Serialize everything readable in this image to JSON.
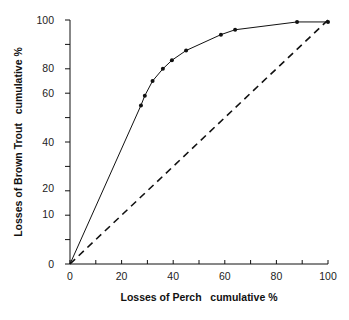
{
  "chart_data": {
    "type": "line",
    "title": "",
    "xlabel": "Losses of Perch   cumulative %",
    "ylabel": "Losses of Brown Trout   cumulative %",
    "xlim": [
      0,
      100
    ],
    "ylim": [
      0,
      100
    ],
    "grid": false,
    "legend": null,
    "x_ticks": [
      0,
      10,
      20,
      30,
      40,
      50,
      60,
      70,
      80,
      90,
      100
    ],
    "x_tick_labels": [
      {
        "value": 0,
        "label": "0"
      },
      {
        "value": 20,
        "label": "20"
      },
      {
        "value": 40,
        "label": "40"
      },
      {
        "value": 60,
        "label": "60"
      },
      {
        "value": 80,
        "label": "80"
      },
      {
        "value": 100,
        "label": "100"
      }
    ],
    "y_ticks": [
      0,
      10,
      20,
      30,
      40,
      50,
      60,
      70,
      80,
      90,
      100
    ],
    "y_tick_labels": [
      {
        "pos": 0,
        "label": "0"
      },
      {
        "pos": 20.5,
        "label": "10"
      },
      {
        "pos": 31,
        "label": "20"
      },
      {
        "pos": 50,
        "label": "40"
      },
      {
        "pos": 70,
        "label": "60"
      },
      {
        "pos": 80.5,
        "label": "80"
      },
      {
        "pos": 100,
        "label": "100"
      }
    ],
    "series": [
      {
        "name": "Observed cumulative losses",
        "style": "solid",
        "markers": true,
        "x": [
          0,
          27.5,
          29,
          32,
          36,
          39.5,
          45,
          58.5,
          64,
          88,
          100
        ],
        "y": [
          0,
          65,
          69,
          75,
          80,
          83.5,
          87.5,
          94,
          96,
          99.2,
          99.2
        ]
      },
      {
        "name": "Equal losses reference",
        "style": "dashed",
        "markers": false,
        "x": [
          0,
          100
        ],
        "y": [
          0,
          100
        ]
      }
    ]
  }
}
